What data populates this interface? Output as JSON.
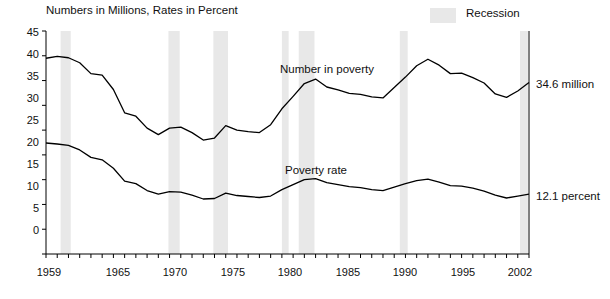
{
  "chart_data": {
    "type": "line",
    "title": "Numbers in Millions, Rates in Percent",
    "xlabel": "",
    "ylabel": "",
    "xlim": [
      1959,
      2002
    ],
    "ylim": [
      0,
      45
    ],
    "grid": false,
    "legend_position": "top-right",
    "legend": [
      {
        "label": "Recession",
        "color": "#e8e8e8",
        "type": "band"
      }
    ],
    "yticks": [
      0,
      5,
      10,
      15,
      20,
      25,
      30,
      35,
      40,
      45
    ],
    "xticks": [
      1959,
      1965,
      1970,
      1975,
      1980,
      1985,
      1990,
      1995,
      2002
    ],
    "annotations": [
      {
        "text": "Number in poverty",
        "x": 1983,
        "y": 37.6
      },
      {
        "text": "Poverty rate",
        "x": 1984,
        "y": 17.2
      },
      {
        "text": "34.6 million",
        "x": 2002.5,
        "y": 33.6
      },
      {
        "text": "12.1 percent",
        "x": 2002.5,
        "y": 12.1
      }
    ],
    "recession_bands": [
      {
        "start": 1960.3,
        "end": 1961.2
      },
      {
        "start": 1969.9,
        "end": 1970.9
      },
      {
        "start": 1973.9,
        "end": 1975.2
      },
      {
        "start": 1980.0,
        "end": 1980.6
      },
      {
        "start": 1981.5,
        "end": 1982.9
      },
      {
        "start": 1990.5,
        "end": 1991.2
      },
      {
        "start": 2001.2,
        "end": 2001.9
      }
    ],
    "series": [
      {
        "name": "Number in poverty",
        "unit": "millions",
        "x": [
          1959,
          1960,
          1961,
          1962,
          1963,
          1964,
          1965,
          1966,
          1967,
          1968,
          1969,
          1970,
          1971,
          1972,
          1973,
          1974,
          1975,
          1976,
          1977,
          1978,
          1979,
          1980,
          1981,
          1982,
          1983,
          1984,
          1985,
          1986,
          1987,
          1988,
          1989,
          1990,
          1991,
          1992,
          1993,
          1994,
          1995,
          1996,
          1997,
          1998,
          1999,
          2000,
          2001,
          2002
        ],
        "values": [
          39.5,
          39.9,
          39.6,
          38.6,
          36.4,
          36.1,
          33.2,
          28.5,
          27.8,
          25.4,
          24.1,
          25.4,
          25.6,
          24.5,
          23.0,
          23.4,
          25.9,
          25.0,
          24.7,
          24.5,
          26.1,
          29.3,
          31.8,
          34.4,
          35.3,
          33.7,
          33.1,
          32.4,
          32.2,
          31.7,
          31.5,
          33.6,
          35.7,
          38.0,
          39.3,
          38.1,
          36.4,
          36.5,
          35.6,
          34.5,
          32.3,
          31.6,
          32.9,
          34.6
        ]
      },
      {
        "name": "Poverty rate",
        "unit": "percent",
        "x": [
          1959,
          1960,
          1961,
          1962,
          1963,
          1964,
          1965,
          1966,
          1967,
          1968,
          1969,
          1970,
          1971,
          1972,
          1973,
          1974,
          1975,
          1976,
          1977,
          1978,
          1979,
          1980,
          1981,
          1982,
          1983,
          1984,
          1985,
          1986,
          1987,
          1988,
          1989,
          1990,
          1991,
          1992,
          1993,
          1994,
          1995,
          1996,
          1997,
          1998,
          1999,
          2000,
          2001,
          2002
        ],
        "values": [
          22.4,
          22.2,
          21.9,
          21.0,
          19.5,
          19.0,
          17.3,
          14.7,
          14.2,
          12.8,
          12.1,
          12.6,
          12.5,
          11.9,
          11.1,
          11.2,
          12.3,
          11.8,
          11.6,
          11.4,
          11.7,
          13.0,
          14.0,
          15.0,
          15.2,
          14.4,
          14.0,
          13.6,
          13.4,
          13.0,
          12.8,
          13.5,
          14.2,
          14.8,
          15.1,
          14.5,
          13.8,
          13.7,
          13.3,
          12.7,
          11.9,
          11.3,
          11.7,
          12.1
        ]
      }
    ]
  },
  "labels": {
    "title": "Numbers in Millions, Rates in Percent",
    "legend_recession": "Recession",
    "annot_number": "Number in poverty",
    "annot_rate": "Poverty rate",
    "end_number": "34.6 million",
    "end_rate": "12.1 percent",
    "y_0": "0",
    "y_5": "5",
    "y_10": "10",
    "y_15": "15",
    "y_20": "20",
    "y_25": "25",
    "y_30": "30",
    "y_35": "35",
    "y_40": "40",
    "y_45": "45",
    "x_1959": "1959",
    "x_1965": "1965",
    "x_1970": "1970",
    "x_1975": "1975",
    "x_1980": "1980",
    "x_1985": "1985",
    "x_1990": "1990",
    "x_1995": "1995",
    "x_2002": "2002"
  }
}
